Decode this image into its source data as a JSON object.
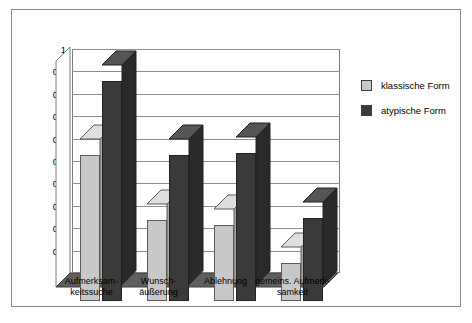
{
  "chart_data": {
    "type": "bar",
    "title": "",
    "xlabel": "",
    "ylabel": "",
    "ylim": [
      0,
      1
    ],
    "ytick_labels": [
      "1",
      "0,9",
      "0,8",
      "0,7",
      "0,6",
      "0,5",
      "0,4",
      "0,3",
      "0,2",
      "0,1",
      "0"
    ],
    "ytick_values": [
      1,
      0.9,
      0.8,
      0.7,
      0.6,
      0.5,
      0.4,
      0.3,
      0.2,
      0.1,
      0
    ],
    "grid": true,
    "legend_position": "right",
    "style": "3d-column",
    "categories": [
      "Aufmerksam-\nkeitssuche",
      "Wunsch-\näußerung",
      "Ablehnung",
      "gemeins. Aufmerk-\nsamkeit"
    ],
    "series": [
      {
        "name": "klassische Form",
        "color": "#c8c8c8",
        "values": [
          0.65,
          0.36,
          0.34,
          0.17
        ]
      },
      {
        "name": "atypische Form",
        "color": "#3a3a3a",
        "values": [
          0.98,
          0.65,
          0.66,
          0.37
        ]
      }
    ]
  },
  "legend": {
    "items": [
      {
        "label": "klassische Form",
        "color": "#c8c8c8"
      },
      {
        "label": "atypische Form",
        "color": "#3a3a3a"
      }
    ]
  },
  "colors": {
    "light_series": "#c8c8c8",
    "light_series_top": "#dedede",
    "light_series_side": "#a9a9a9",
    "dark_series": "#3a3a3a",
    "dark_series_top": "#555555",
    "dark_series_side": "#2a2a2a",
    "floor": "#5e5e5e",
    "grid": "#8d8d8d",
    "frame": "#8a8a8a"
  }
}
